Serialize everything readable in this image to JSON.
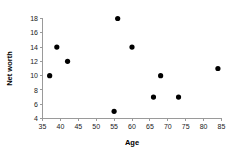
{
  "chart_data": {
    "type": "scatter",
    "title": "",
    "xlabel": "Age",
    "ylabel": "Net worth",
    "xlim": [
      35,
      85
    ],
    "ylim": [
      4,
      18
    ],
    "xticks": [
      35,
      40,
      45,
      50,
      55,
      60,
      65,
      70,
      75,
      80,
      85
    ],
    "xtick_labels": [
      "35",
      "40",
      "45",
      "50",
      "55",
      "60",
      "65",
      "70",
      "75",
      "80",
      "85"
    ],
    "yticks": [
      4,
      6,
      8,
      10,
      12,
      14,
      16,
      18
    ],
    "ytick_labels": [
      "4",
      "6",
      "8",
      "10",
      "12",
      "14",
      "16",
      "18"
    ],
    "grid": false,
    "legend": false,
    "marker_color": "#000000",
    "axis_color": "#9a9a9a",
    "points": [
      {
        "x": 37,
        "y": 10
      },
      {
        "x": 39,
        "y": 14
      },
      {
        "x": 42,
        "y": 12
      },
      {
        "x": 55,
        "y": 5
      },
      {
        "x": 56,
        "y": 18
      },
      {
        "x": 60,
        "y": 14
      },
      {
        "x": 66,
        "y": 7
      },
      {
        "x": 68,
        "y": 10
      },
      {
        "x": 73,
        "y": 7
      },
      {
        "x": 84,
        "y": 11
      }
    ]
  }
}
